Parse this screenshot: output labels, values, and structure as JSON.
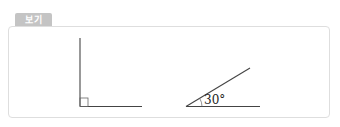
{
  "header": {
    "tab_label": "보기"
  },
  "figures": [
    {
      "name": "right-angle",
      "type": "right angle (90°) with square marker",
      "vertex": [
        80,
        106
      ],
      "arm_vertical_end": [
        80,
        38
      ],
      "arm_horizontal_end": [
        142,
        106
      ]
    },
    {
      "name": "angle-30",
      "type": "acute angle",
      "label": "30°",
      "vertex": [
        186,
        106
      ],
      "arm_horizontal_end": [
        260,
        106
      ],
      "arm_slant_end": [
        250,
        68
      ]
    }
  ],
  "colors": {
    "tab_bg": "#c4c4c4",
    "tab_text": "#ffffff",
    "box_border": "#dedede",
    "line": "#333333"
  }
}
